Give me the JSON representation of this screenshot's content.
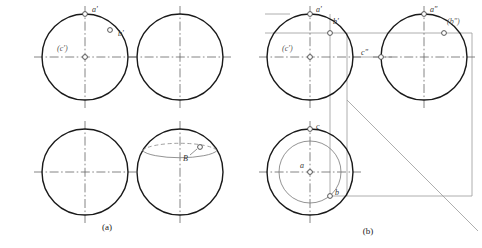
{
  "figure": {
    "title_caption_a": "(a)",
    "title_caption_b": "(b)",
    "background_color": "#ffffff",
    "outline_color": "#1a1a1a",
    "centerline_color": "#555555",
    "projection_line_color": "#888888",
    "thin_line_color": "#666666"
  },
  "panel_a": {
    "caption": "(a)",
    "views": [
      {
        "name": "front-view",
        "center": [
          85,
          57
        ],
        "radius": 43,
        "labels": [
          {
            "text": "a'",
            "x": 92,
            "y": 12,
            "point": [
              85,
              14
            ]
          },
          {
            "text": "b'",
            "x": 118,
            "y": 35,
            "point": [
              110,
              30
            ]
          },
          {
            "text": "(c')",
            "x": 60,
            "y": 50,
            "point": [
              85,
              57
            ]
          }
        ]
      },
      {
        "name": "top-view-empty-right",
        "center": [
          180,
          57
        ],
        "radius": 43,
        "labels": []
      },
      {
        "name": "bottom-left-empty",
        "center": [
          85,
          172
        ],
        "radius": 43,
        "labels": []
      },
      {
        "name": "pictorial-sphere",
        "center": [
          180,
          172
        ],
        "radius": 43,
        "labels": [
          {
            "text": "B",
            "x": 188,
            "y": 156,
            "point": [
              196,
              147
            ]
          }
        ]
      }
    ]
  },
  "panel_b": {
    "caption": "(b)",
    "views": [
      {
        "name": "front-view",
        "center": [
          310,
          57
        ],
        "radius": 43,
        "labels": [
          {
            "text": "a'",
            "x": 316,
            "y": 12,
            "point": [
              310,
              14
            ]
          },
          {
            "text": "b'",
            "x": 336,
            "y": 22,
            "point": [
              330,
              33
            ]
          },
          {
            "text": "(c')",
            "x": 285,
            "y": 50,
            "point": [
              310,
              57
            ]
          }
        ]
      },
      {
        "name": "side-view",
        "center": [
          424,
          57
        ],
        "radius": 43,
        "labels": [
          {
            "text": "a\"",
            "x": 430,
            "y": 12,
            "point": [
              424,
              14
            ]
          },
          {
            "text": "(b\")",
            "x": 450,
            "y": 22,
            "point": [
              444,
              33
            ]
          },
          {
            "text": "c\"",
            "x": 371,
            "y": 51,
            "point": [
              381,
              57
            ]
          }
        ]
      },
      {
        "name": "top-view",
        "center": [
          310,
          172
        ],
        "radius": 43,
        "inner_radius": 31,
        "labels": [
          {
            "text": "c",
            "x": 316,
            "y": 128,
            "point": [
              310,
              129
            ]
          },
          {
            "text": "a",
            "x": 301,
            "y": 166,
            "point": [
              310,
              172
            ]
          },
          {
            "text": "b",
            "x": 336,
            "y": 193,
            "point": [
              329,
              196
            ]
          }
        ]
      }
    ],
    "construction": {
      "miter_line_label": "45-degree-miter-line",
      "miter_start": [
        347,
        100
      ],
      "miter_end": [
        472,
        225
      ]
    }
  },
  "points": {
    "a_prime": "a'",
    "b_prime": "b'",
    "c_prime": "(c')",
    "a_double_prime": "a\"",
    "b_double_prime": "(b\")",
    "c_double_prime": "c\"",
    "a_lower": "a",
    "b_lower": "b",
    "c_lower": "c",
    "B_upper": "B"
  }
}
